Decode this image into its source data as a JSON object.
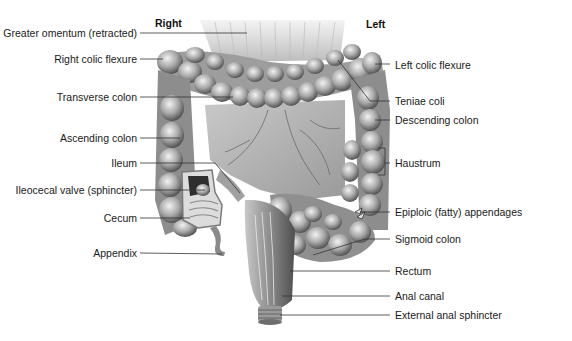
{
  "figure": {
    "orientation": {
      "right_label": "Right",
      "left_label": "Left"
    },
    "labels_left": [
      {
        "text": "Greater omentum (retracted)",
        "y": 33,
        "line_to_x": 247,
        "line_to_y": 33
      },
      {
        "text": "Right colic flexure",
        "y": 59,
        "line_to_x": 163,
        "line_to_y": 59
      },
      {
        "text": "Transverse colon",
        "y": 97,
        "line_to_x": 233,
        "line_to_y": 97
      },
      {
        "text": "Ascending colon",
        "y": 138,
        "line_to_x": 180,
        "line_to_y": 138
      },
      {
        "text": "Ileum",
        "y": 163,
        "line_to_x": 240,
        "line_to_y": 193
      },
      {
        "text": "Ileocecal valve (sphincter)",
        "y": 190,
        "line_to_x": 205,
        "line_to_y": 190
      },
      {
        "text": "Cecum",
        "y": 218,
        "line_to_x": 190,
        "line_to_y": 218
      },
      {
        "text": "Appendix",
        "y": 253,
        "line_to_x": 222,
        "line_to_y": 254
      }
    ],
    "labels_right": [
      {
        "text": "Left colic flexure",
        "y": 65,
        "line_from_x": 375,
        "line_from_y": 64
      },
      {
        "text": "Teniae coli",
        "y": 101,
        "line_from_x": 338,
        "line_from_y": 60
      },
      {
        "text": "Descending colon",
        "y": 120,
        "line_from_x": 375,
        "line_from_y": 120
      },
      {
        "text": "Haustrum",
        "y": 163,
        "line_from_x": 385,
        "line_from_y": 163
      },
      {
        "text": "Epiploic (fatty) appendages",
        "y": 212,
        "line_from_x": 360,
        "line_from_y": 213
      },
      {
        "text": "Sigmoid colon",
        "y": 239,
        "line_from_x": 313,
        "line_from_y": 255
      },
      {
        "text": "Rectum",
        "y": 271,
        "line_from_x": 290,
        "line_from_y": 271
      },
      {
        "text": "Anal canal",
        "y": 296,
        "line_from_x": 282,
        "line_from_y": 296
      },
      {
        "text": "External anal sphincter",
        "y": 315,
        "line_from_x": 280,
        "line_from_y": 315
      }
    ]
  },
  "colors": {
    "background": "#ffffff",
    "text": "#1a1a1a",
    "leader_line": "#333333",
    "tissue_light": "#d9d9d9",
    "tissue_mid": "#a8a8a8",
    "tissue_dark": "#5e5e5e"
  }
}
